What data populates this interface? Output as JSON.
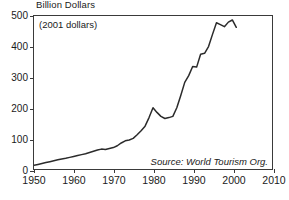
{
  "chart_data": {
    "type": "line",
    "title": "",
    "ylabel": "Billion Dollars",
    "xlabel": "",
    "annotation_units": "(2001 dollars)",
    "annotation_source": "Source: World Tourism Org.",
    "xlim": [
      1950,
      2010
    ],
    "ylim": [
      0,
      500
    ],
    "xticks": [
      1950,
      1960,
      1970,
      1980,
      1990,
      2000,
      2010
    ],
    "yticks": [
      0,
      100,
      200,
      300,
      400,
      500
    ],
    "grid": false,
    "legend": "none",
    "line_color": "#2b2b2b",
    "series": [
      {
        "name": "International tourism receipts",
        "x": [
          1950,
          1951,
          1952,
          1953,
          1954,
          1955,
          1956,
          1957,
          1958,
          1959,
          1960,
          1961,
          1962,
          1963,
          1964,
          1965,
          1966,
          1967,
          1968,
          1969,
          1970,
          1971,
          1972,
          1973,
          1974,
          1975,
          1976,
          1977,
          1978,
          1979,
          1980,
          1981,
          1982,
          1983,
          1984,
          1985,
          1986,
          1987,
          1988,
          1989,
          1990,
          1991,
          1992,
          1993,
          1994,
          1995,
          1996,
          1997,
          1998,
          1999,
          2000,
          2001
        ],
        "values": [
          12,
          15,
          18,
          21,
          24,
          27,
          30,
          33,
          35,
          38,
          41,
          44,
          47,
          50,
          54,
          58,
          62,
          65,
          64,
          67,
          70,
          76,
          85,
          92,
          95,
          100,
          112,
          125,
          140,
          168,
          200,
          185,
          172,
          165,
          168,
          172,
          200,
          240,
          283,
          305,
          335,
          333,
          375,
          378,
          400,
          440,
          478,
          472,
          465,
          480,
          487,
          463
        ]
      }
    ]
  }
}
